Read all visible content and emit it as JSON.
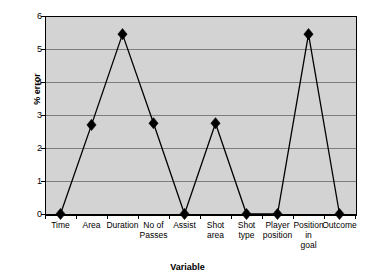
{
  "chart_data": {
    "type": "line",
    "title": "",
    "xlabel": "Variable",
    "ylabel": "% error",
    "categories": [
      "Time",
      "Area",
      "Duration",
      "No of\nPasses",
      "Assist",
      "Shot\narea",
      "Shot\ntype",
      "Player\nposition",
      "Position\nin\ngoal",
      "Outcome"
    ],
    "values": [
      0,
      2.7,
      5.45,
      2.75,
      0,
      2.75,
      0,
      0,
      5.45,
      0
    ],
    "ylim": [
      0,
      6
    ],
    "y_ticks": [
      "0",
      "1",
      "2",
      "3",
      "4",
      "5",
      "6"
    ],
    "y_tick_values": [
      0,
      1,
      2,
      3,
      4,
      5,
      6
    ],
    "grid": true,
    "legend": "none",
    "marker": "diamond",
    "series": [
      {
        "name": "% error",
        "values": [
          0,
          2.7,
          5.45,
          2.75,
          0,
          2.75,
          0,
          0,
          5.45,
          0
        ]
      }
    ],
    "colors": {
      "plot_background": "#d3d3d3",
      "gridline": "#7d7d7d",
      "axis": "#000000",
      "line": "#000000",
      "marker": "#000000",
      "page_background": "#ffffff"
    }
  }
}
